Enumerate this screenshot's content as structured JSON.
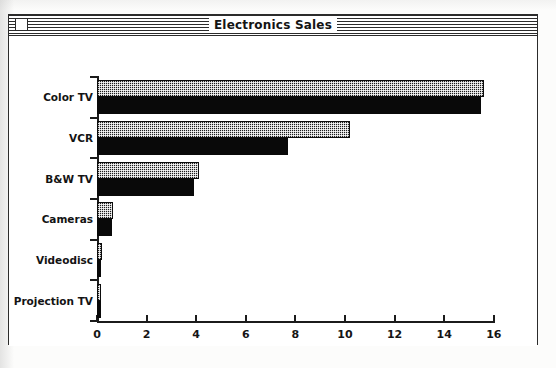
{
  "window": {
    "title": "Electronics Sales",
    "close_box": "close-box"
  },
  "chart_data": {
    "type": "bar",
    "orientation": "horizontal",
    "title": "Electronics Sales",
    "xlabel": "",
    "ylabel": "",
    "xlim": [
      0,
      16
    ],
    "grid": false,
    "legend": "none",
    "xticks": [
      "0",
      "2",
      "4",
      "6",
      "8",
      "10",
      "12",
      "14",
      "16"
    ],
    "xtick_values": [
      0,
      2,
      4,
      6,
      8,
      10,
      12,
      14,
      16
    ],
    "categories": [
      "Color TV",
      "VCR",
      "B&W TV",
      "Cameras",
      "Videodisc",
      "Projection TV"
    ],
    "series": [
      {
        "name": "Series 1",
        "pattern": "stippled",
        "values": [
          15.6,
          10.2,
          4.1,
          0.65,
          0.2,
          0.18
        ]
      },
      {
        "name": "Series 2",
        "pattern": "solid-black",
        "values": [
          15.5,
          7.7,
          3.9,
          0.62,
          0.18,
          0.15
        ]
      }
    ]
  },
  "colors": {
    "ink": "#1b1b1b",
    "bar_solid": "#090909",
    "paper": "#ffffff"
  }
}
